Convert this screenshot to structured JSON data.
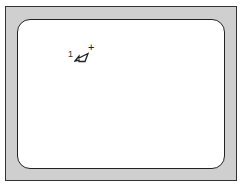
{
  "figure": {
    "bezel_color": "#cfcfcf",
    "border_color": "#333333",
    "screen_color": "#ffffff"
  },
  "cursor": {
    "index_label": "1",
    "icon": "pointer-arrow-icon",
    "modifier": "+"
  }
}
